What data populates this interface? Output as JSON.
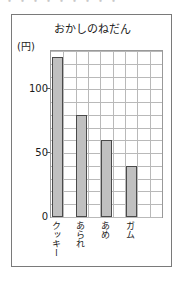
{
  "page": {
    "bleed_text": "・・・・・・・・・"
  },
  "chart_data": {
    "type": "bar",
    "title": "おかしのねだん",
    "xlabel": "",
    "ylabel": "(円)",
    "unit_label": "(円)",
    "categories": [
      "クッキー",
      "あられ",
      "あめ",
      "ガム"
    ],
    "values": [
      125,
      80,
      60,
      40
    ],
    "ylim": [
      0,
      130
    ],
    "ytick_labels": [
      "0",
      "50",
      "100"
    ],
    "ytick_values": [
      0,
      50,
      100
    ],
    "grid": true,
    "grid_step": 10,
    "vertical_gridlines": 9,
    "legend": null,
    "bar_fill_color": "#c0c0c0",
    "bar_border_color": "#4a4a4a",
    "grid_color": "#b9b9b9",
    "frame_color": "#7a7a7a"
  }
}
